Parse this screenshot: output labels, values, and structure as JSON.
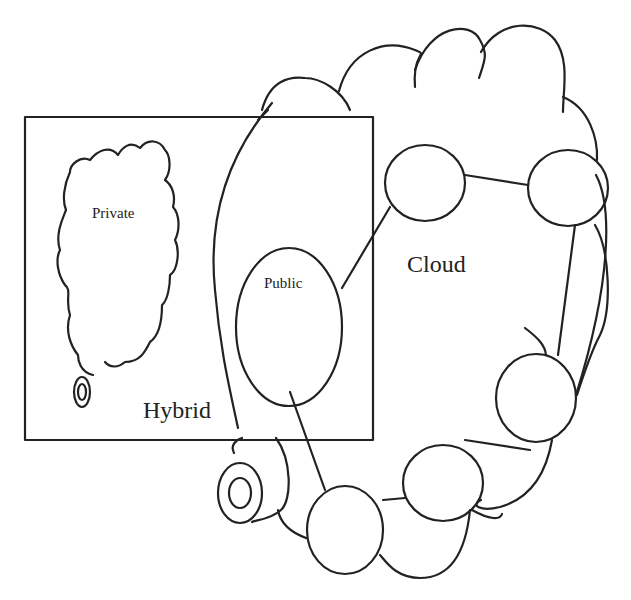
{
  "diagram": {
    "type": "cloud-deployment-models",
    "labels": {
      "private": "Private",
      "public": "Public",
      "cloud": "Cloud",
      "hybrid": "Hybrid"
    },
    "colors": {
      "stroke": "#222222",
      "background": "#ffffff"
    },
    "nodes": [
      {
        "id": "public-ellipse",
        "label": "Public"
      },
      {
        "id": "node-top-left"
      },
      {
        "id": "node-top-right"
      },
      {
        "id": "node-right"
      },
      {
        "id": "node-bottom-right"
      },
      {
        "id": "node-bottom"
      }
    ],
    "groups": [
      {
        "id": "hybrid-box",
        "label": "Hybrid"
      },
      {
        "id": "private-cloud",
        "label": "Private"
      },
      {
        "id": "cloud-outline",
        "label": "Cloud"
      }
    ]
  }
}
